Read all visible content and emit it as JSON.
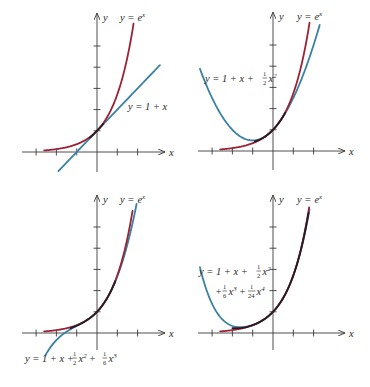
{
  "figure": {
    "colors": {
      "exp_curve": "#9b2335",
      "poly_curve": "#3a82a4",
      "overlap": "#2a1a22",
      "axis": "#3a3a3a"
    },
    "axis_labels": {
      "x": "x",
      "y": "y"
    }
  },
  "chart_data": [
    {
      "type": "line",
      "panel": "top-left",
      "title": "",
      "xlabel": "x",
      "ylabel": "y",
      "x_ticks": [
        -3,
        -2,
        -1,
        1,
        2
      ],
      "y_ticks": [
        1,
        2,
        3,
        4,
        5
      ],
      "series": [
        {
          "name": "y = e^x",
          "function": "exp",
          "x_range": [
            -2.6,
            1.8
          ]
        },
        {
          "name": "y = 1 + x",
          "function": "taylor1",
          "x_range": [
            -1.9,
            3.1
          ]
        }
      ],
      "labels": [
        {
          "text": "y = e^x",
          "series": 0
        },
        {
          "text": "y = 1 + x",
          "series": 1
        }
      ]
    },
    {
      "type": "line",
      "panel": "top-right",
      "title": "",
      "xlabel": "x",
      "ylabel": "y",
      "x_ticks": [
        -3,
        -2,
        -1,
        1,
        2
      ],
      "y_ticks": [
        1,
        2,
        3,
        4,
        5
      ],
      "series": [
        {
          "name": "y = e^x",
          "function": "exp",
          "x_range": [
            -2.6,
            1.8
          ]
        },
        {
          "name": "y = 1 + x + (1/2)x^2",
          "function": "taylor2",
          "x_range": [
            -3.6,
            2.3
          ]
        }
      ],
      "labels": [
        {
          "text": "y = e^x",
          "series": 0
        },
        {
          "text": "y = 1 + x + ½x²",
          "series": 1
        }
      ]
    },
    {
      "type": "line",
      "panel": "bottom-left",
      "title": "",
      "xlabel": "x",
      "ylabel": "y",
      "x_ticks": [
        -3,
        -2,
        -1,
        1,
        2
      ],
      "y_ticks": [
        1,
        2,
        3,
        4,
        5
      ],
      "series": [
        {
          "name": "y = e^x",
          "function": "exp",
          "x_range": [
            -2.6,
            1.75
          ]
        },
        {
          "name": "y = 1 + x + (1/2)x^2 + (1/6)x^3",
          "function": "taylor3",
          "x_range": [
            -2.55,
            1.95
          ]
        }
      ],
      "labels": [
        {
          "text": "y = e^x",
          "series": 0
        },
        {
          "text": "y = 1 + x + ½x² + ⅙x³",
          "series": 1
        }
      ]
    },
    {
      "type": "line",
      "panel": "bottom-right",
      "title": "",
      "xlabel": "x",
      "ylabel": "y",
      "x_ticks": [
        -3,
        -2,
        -1,
        1,
        2
      ],
      "y_ticks": [
        1,
        2,
        3,
        4,
        5
      ],
      "series": [
        {
          "name": "y = e^x",
          "function": "exp",
          "x_range": [
            -2.6,
            1.78
          ]
        },
        {
          "name": "y = 1 + x + (1/2)x^2 + (1/6)x^3 + (1/24)x^4",
          "function": "taylor4",
          "x_range": [
            -3.6,
            1.8
          ]
        }
      ],
      "labels": [
        {
          "text": "y = e^x",
          "series": 0
        },
        {
          "text": "y = 1 + x + ½x² + ⅙x³ + (1/24)x⁴",
          "series": 1
        }
      ]
    }
  ],
  "labels": {
    "y_eq": "y =",
    "e": "e",
    "x": "x",
    "p1_line": "y = 1 + x",
    "p2_a": "y = 1 + x +",
    "p2_b": "x",
    "p3_a": "y = 1 + x +",
    "p3_b": "x",
    "p3_c": "+",
    "p3_d": "x",
    "p4_a": "y = 1 + x +",
    "p4_b": "x",
    "p4_c": "+",
    "p4_d": "x",
    "p4_e": "+",
    "p4_f": "x",
    "one": "1",
    "two": "2",
    "three": "3",
    "four": "4",
    "six": "6",
    "twentyfour": "24"
  }
}
